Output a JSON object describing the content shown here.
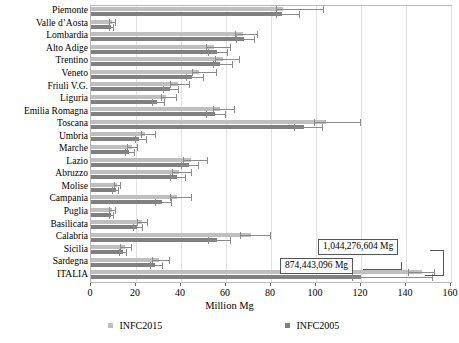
{
  "chart_data": {
    "type": "bar",
    "orientation": "horizontal",
    "title": "",
    "xlabel": "Million Mg",
    "ylabel": "",
    "xlim": [
      0,
      160
    ],
    "xticks": [
      0,
      20,
      40,
      60,
      80,
      100,
      120,
      140,
      160
    ],
    "grid": true,
    "legend_position": "bottom",
    "categories": [
      "Piemonte",
      "Valle d’Aosta",
      "Lombardia",
      "Alto Adige",
      "Trentino",
      "Veneto",
      "Friuli V.G.",
      "Liguria",
      "Emilia Romagna",
      "Toscana",
      "Umbria",
      "Marche",
      "Lazio",
      "Abruzzo",
      "Molise",
      "Campania",
      "Puglia",
      "Basilicata",
      "Calabria",
      "Sicilia",
      "Sardegna",
      "ITALIA"
    ],
    "series": [
      {
        "name": "INFC2015",
        "color": "#bfbfbf",
        "values": [
          85.5,
          9.5,
          67.5,
          54.5,
          58.5,
          48.0,
          38.5,
          33.5,
          57.5,
          104.5,
          24.0,
          18.0,
          44.5,
          39.0,
          11.5,
          38.0,
          9.5,
          22.5,
          71.0,
          15.0,
          30.0,
          147.0
        ],
        "err_low": [
          82.0,
          8.0,
          64.0,
          51.0,
          55.0,
          45.0,
          35.0,
          31.0,
          54.0,
          99.0,
          22.0,
          16.0,
          41.0,
          36.0,
          10.0,
          35.0,
          8.0,
          20.5,
          66.0,
          13.0,
          27.0,
          141.0
        ],
        "err_high": [
          103.5,
          11.0,
          74.0,
          62.0,
          66.0,
          56.0,
          44.0,
          38.0,
          64.0,
          120.0,
          29.0,
          21.0,
          52.0,
          45.0,
          13.5,
          45.0,
          11.0,
          25.5,
          80.0,
          18.0,
          35.0,
          153.0
        ]
      },
      {
        "name": "INFC2005",
        "color": "#808080",
        "values": [
          85.0,
          9.0,
          68.0,
          56.0,
          57.5,
          45.0,
          35.0,
          29.5,
          55.0,
          94.5,
          21.5,
          17.0,
          43.5,
          38.0,
          11.0,
          31.5,
          9.0,
          20.5,
          56.0,
          14.0,
          28.5,
          120.0
        ],
        "err_low": [
          82.0,
          8.0,
          64.5,
          52.0,
          54.0,
          42.0,
          32.0,
          27.0,
          51.0,
          90.0,
          19.5,
          15.0,
          40.0,
          35.0,
          9.5,
          28.5,
          8.0,
          18.5,
          52.0,
          12.5,
          26.0,
          116.0
        ],
        "err_high": [
          93.0,
          10.0,
          73.0,
          61.0,
          63.0,
          50.0,
          39.0,
          33.0,
          60.0,
          103.0,
          25.0,
          19.5,
          48.0,
          42.0,
          12.5,
          36.0,
          10.0,
          23.0,
          62.0,
          16.0,
          32.0,
          152.0
        ]
      }
    ],
    "annotations": [
      {
        "text": "1,044,276,604 Mg",
        "target_series": "INFC2015",
        "target_category": "ITALIA"
      },
      {
        "text": "874,443,096 Mg",
        "target_series": "INFC2005",
        "target_category": "ITALIA"
      }
    ]
  },
  "axis": {
    "x_title": "Million Mg",
    "tick_labels": [
      "0",
      "20",
      "40",
      "60",
      "80",
      "100",
      "120",
      "140",
      "160"
    ]
  },
  "legend": {
    "items": [
      {
        "label": "INFC2015",
        "color": "#bfbfbf"
      },
      {
        "label": "INFC2005",
        "color": "#808080"
      }
    ]
  },
  "callouts": {
    "upper": "1,044,276,604 Mg",
    "lower": "874,443,096 Mg"
  }
}
